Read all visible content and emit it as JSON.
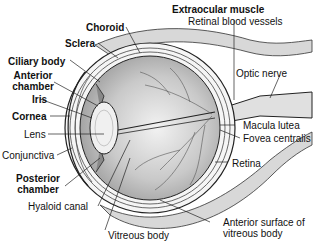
{
  "diagram": {
    "labels": {
      "extraocular_muscle": "Extraocular muscle",
      "retinal_blood_vessels": "Retinal blood vessels",
      "choroid": "Choroid",
      "sclera": "Sclera",
      "ciliary_body": "Ciliary body",
      "anterior_chamber_1": "Anterior",
      "anterior_chamber_2": "chamber",
      "iris": "Iris",
      "cornea": "Cornea",
      "lens": "Lens",
      "conjunctiva": "Conjunctiva",
      "posterior_chamber_1": "Posterior",
      "posterior_chamber_2": "chamber",
      "hyaloid_canal": "Hyaloid canal",
      "vitreous_body": "Vitreous body",
      "optic_nerve": "Optic nerve",
      "macula_lutea": "Macula lutea",
      "fovea_centralis": "Fovea centralis",
      "retina": "Retina",
      "anterior_surface_1": "Anterior surface of",
      "anterior_surface_2": "vitreous body"
    }
  }
}
